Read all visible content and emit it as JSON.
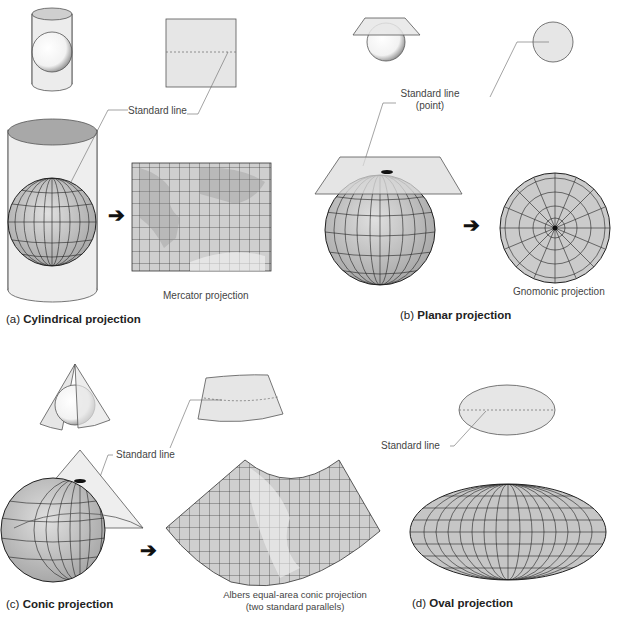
{
  "figure": {
    "panels": [
      {
        "id": "a",
        "letter": "(a)",
        "title": "Cylindrical projection",
        "standard_line_label": "Standard line",
        "result_label": "Mercator projection"
      },
      {
        "id": "b",
        "letter": "(b)",
        "title": "Planar projection",
        "standard_line_label": "Standard line",
        "standard_line_sub": "(point)",
        "result_label": "Gnomonic projection"
      },
      {
        "id": "c",
        "letter": "(c)",
        "title": "Conic projection",
        "standard_line_label": "Standard line",
        "result_label": "Albers equal-area conic projection",
        "result_sub": "(two standard parallels)",
        "longitude_ticks": [
          "160° W",
          "140° W",
          "120° W",
          "100° W",
          "80° W",
          "60° W"
        ],
        "latitude_ticks": [
          "60° N",
          "50° N",
          "40° N",
          "30° N",
          "20° N"
        ]
      },
      {
        "id": "d",
        "letter": "(d)",
        "title": "Oval projection",
        "standard_line_label": "Standard line"
      }
    ],
    "arrow_icon": "➔",
    "colors": {
      "surface_fill": "#e6e6e6",
      "surface_stroke": "#555555",
      "graticule": "#333333",
      "globe_fill": "#c8c8c8",
      "leader_line": "#666666"
    }
  }
}
